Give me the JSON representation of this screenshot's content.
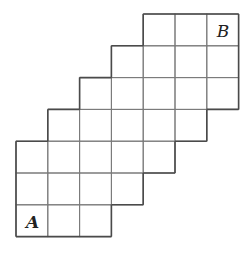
{
  "diagram": {
    "type": "staircase-grid",
    "cell_size": 31.8,
    "origin": {
      "x": 16,
      "y": 14
    },
    "columns": 7,
    "rows": 7,
    "row_spans": [
      {
        "row": 0,
        "from_col": 4,
        "to_col": 6
      },
      {
        "row": 1,
        "from_col": 3,
        "to_col": 6
      },
      {
        "row": 2,
        "from_col": 2,
        "to_col": 6
      },
      {
        "row": 3,
        "from_col": 1,
        "to_col": 5
      },
      {
        "row": 4,
        "from_col": 0,
        "to_col": 4
      },
      {
        "row": 5,
        "from_col": 0,
        "to_col": 3
      },
      {
        "row": 6,
        "from_col": 0,
        "to_col": 2
      }
    ],
    "labels": [
      {
        "id": "A",
        "text": "A",
        "row": 6,
        "col": 0
      },
      {
        "id": "B",
        "text": "B",
        "row": 0,
        "col": 6
      }
    ],
    "colors": {
      "line": "#7a7a7a",
      "outline": "#4a4a4a",
      "label": "#222222",
      "background": "#ffffff"
    }
  }
}
